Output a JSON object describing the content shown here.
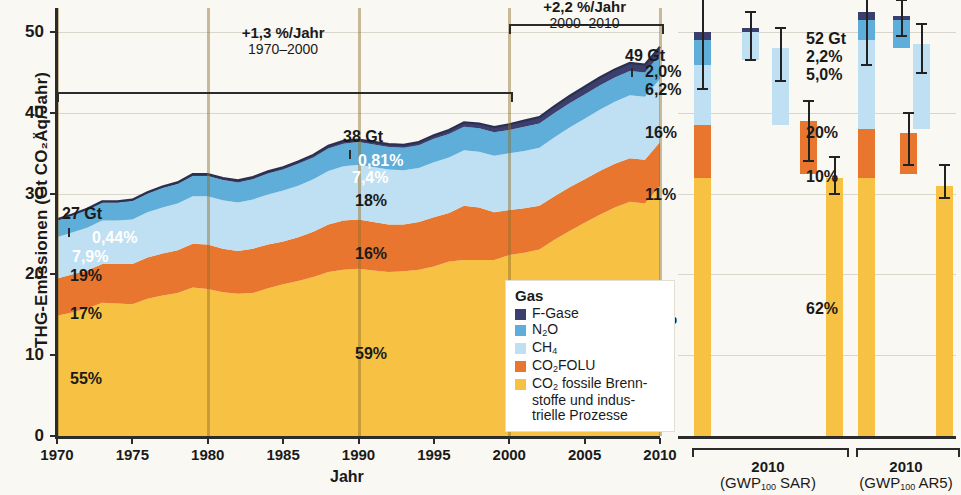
{
  "figure": {
    "y_axis_title": "THG-Emissionen (Gt CO₂Äq/Jahr)",
    "x_axis_title": "Jahr",
    "y_ticks": [
      "0",
      "10",
      "20",
      "30",
      "40",
      "50"
    ],
    "x_ticks": [
      "1970",
      "1975",
      "1980",
      "1985",
      "1990",
      "1995",
      "2000",
      "2005",
      "2010"
    ]
  },
  "annotations": [
    {
      "rate": "+1,3 %/Jahr",
      "period": "1970–2000"
    },
    {
      "rate": "+2,2 %/Jahr",
      "period": "2000–2010"
    }
  ],
  "callouts": [
    {
      "year": "1970",
      "total": "27 Gt",
      "shares": [
        "0,44%",
        "7,9%",
        "19%",
        "17%",
        "55%"
      ]
    },
    {
      "year": "1990",
      "total": "38 Gt",
      "shares": [
        "0,81%",
        "7,4%",
        "18%",
        "16%",
        "59%"
      ]
    },
    {
      "year": "2010",
      "total": "49 Gt",
      "shares": [
        "2,0%",
        "6,2%",
        "16%",
        "11%",
        "65%"
      ]
    }
  ],
  "right_panels": [
    {
      "total": "52 Gt",
      "shares": [
        "2,2%",
        "5,0%",
        "20%",
        "10%",
        "62%"
      ],
      "group_year": "2010",
      "group_metric_pre": "(GWP",
      "group_metric_sub": "100",
      "group_metric_post": " SAR)"
    },
    {
      "group_year": "2010",
      "group_metric_pre": "(GWP",
      "group_metric_sub": "100",
      "group_metric_post": " AR5)"
    }
  ],
  "legend": {
    "title": "Gas",
    "items": [
      {
        "label_pre": "F-Gase",
        "label_sub": "",
        "label_post": "",
        "color": "#3b3f6e"
      },
      {
        "label_pre": "N",
        "label_sub": "2",
        "label_post": "O",
        "color": "#5fadd9"
      },
      {
        "label_pre": "CH",
        "label_sub": "4",
        "label_post": "",
        "color": "#b9dcf2"
      },
      {
        "label_pre": "CO",
        "label_sub": "2",
        "label_post": "FOLU",
        "color": "#e8762f"
      },
      {
        "label_pre": "CO",
        "label_sub": "2",
        "label_post": " fossile Brenn-",
        "line2": "stoffe und indus-",
        "line3": "trielle Prozesse",
        "color": "#f7c килограм"
      }
    ]
  },
  "colors": {
    "f_gase": "#3b3f6e",
    "n2o": "#5fadd9",
    "ch4": "#bfdff2",
    "co2_folu": "#e8762f",
    "co2_fossil": "#f7c244",
    "grid": "#d9d6cc",
    "axis": "#2b2b2b",
    "background": "#faf8f2"
  },
  "chart_data": {
    "type": "area",
    "title": "",
    "xlabel": "Jahr",
    "ylabel": "THG-Emissionen (Gt CO₂Äq/Jahr)",
    "xlim": [
      1970,
      2010
    ],
    "ylim": [
      0,
      53
    ],
    "ytick_values": [
      0,
      10,
      20,
      30,
      40,
      50
    ],
    "grid": true,
    "legend_position": "inside-bottom-right",
    "x": [
      1970,
      1971,
      1972,
      1973,
      1974,
      1975,
      1976,
      1977,
      1978,
      1979,
      1980,
      1981,
      1982,
      1983,
      1984,
      1985,
      1986,
      1987,
      1988,
      1989,
      1990,
      1991,
      1992,
      1993,
      1994,
      1995,
      1996,
      1997,
      1998,
      1999,
      2000,
      2001,
      2002,
      2003,
      2004,
      2005,
      2006,
      2007,
      2008,
      2009,
      2010
    ],
    "series": [
      {
        "name": "CO2 fossile Brennstoffe und industrielle Prozesse",
        "color": "#f7c244",
        "values": [
          14.9,
          15.3,
          15.8,
          16.5,
          16.4,
          16.3,
          17.0,
          17.4,
          17.7,
          18.4,
          18.2,
          17.8,
          17.6,
          17.7,
          18.3,
          18.8,
          19.2,
          19.7,
          20.3,
          20.6,
          20.7,
          20.5,
          20.3,
          20.4,
          20.6,
          21.0,
          21.6,
          21.8,
          21.8,
          21.8,
          22.4,
          22.7,
          23.1,
          24.3,
          25.4,
          26.4,
          27.4,
          28.3,
          29.0,
          28.8,
          31.0
        ]
      },
      {
        "name": "CO2 FOLU",
        "color": "#e8762f",
        "values": [
          4.6,
          4.7,
          4.7,
          4.8,
          4.9,
          5.0,
          5.1,
          5.2,
          5.3,
          5.4,
          5.5,
          5.4,
          5.3,
          5.5,
          5.4,
          5.3,
          5.4,
          5.6,
          5.9,
          6.1,
          6.1,
          6.0,
          5.9,
          5.8,
          5.9,
          6.1,
          6.0,
          6.7,
          6.5,
          5.9,
          5.6,
          5.5,
          5.4,
          5.4,
          5.4,
          5.4,
          5.4,
          5.4,
          5.4,
          5.4,
          5.4
        ]
      },
      {
        "name": "CH4",
        "color": "#bfdff2",
        "values": [
          5.1,
          5.2,
          5.3,
          5.4,
          5.4,
          5.5,
          5.6,
          5.7,
          5.8,
          5.9,
          6.0,
          6.0,
          6.0,
          6.1,
          6.2,
          6.3,
          6.4,
          6.5,
          6.6,
          6.7,
          6.8,
          6.8,
          6.8,
          6.7,
          6.7,
          6.8,
          6.9,
          6.9,
          6.9,
          7.0,
          7.0,
          7.1,
          7.2,
          7.3,
          7.4,
          7.5,
          7.6,
          7.7,
          7.8,
          7.8,
          7.8
        ]
      },
      {
        "name": "N2O",
        "color": "#5fadd9",
        "values": [
          2.1,
          2.1,
          2.2,
          2.2,
          2.2,
          2.3,
          2.3,
          2.4,
          2.4,
          2.5,
          2.5,
          2.5,
          2.5,
          2.5,
          2.6,
          2.6,
          2.7,
          2.7,
          2.8,
          2.8,
          2.8,
          2.8,
          2.8,
          2.8,
          2.8,
          2.9,
          2.9,
          2.9,
          2.9,
          2.9,
          2.9,
          3.0,
          3.0,
          3.0,
          3.0,
          3.0,
          3.0,
          3.0,
          3.0,
          3.0,
          3.0
        ]
      },
      {
        "name": "F-Gase",
        "color": "#3b3f6e",
        "values": [
          0.12,
          0.13,
          0.14,
          0.15,
          0.16,
          0.17,
          0.18,
          0.19,
          0.2,
          0.22,
          0.23,
          0.24,
          0.25,
          0.26,
          0.27,
          0.28,
          0.3,
          0.31,
          0.33,
          0.34,
          0.31,
          0.32,
          0.34,
          0.36,
          0.4,
          0.45,
          0.5,
          0.55,
          0.6,
          0.65,
          0.7,
          0.75,
          0.8,
          0.85,
          0.9,
          0.95,
          1.0,
          1.0,
          1.0,
          1.0,
          1.0
        ]
      }
    ],
    "totals_labeled": [
      {
        "year": 1970,
        "value": 27,
        "label": "27 Gt"
      },
      {
        "year": 1990,
        "value": 38,
        "label": "38 Gt"
      },
      {
        "year": 2010,
        "value": 49,
        "label": "49 Gt"
      }
    ],
    "growth_annotations": [
      {
        "label": "+1,3 %/Jahr",
        "period": "1970–2000",
        "start": 1970,
        "end": 2000
      },
      {
        "label": "+2,2 %/Jahr",
        "period": "2000–2010",
        "start": 2000,
        "end": 2010
      }
    ],
    "side_panels": [
      {
        "name": "2010 (GWP100 SAR)",
        "total": 49,
        "bars": [
          {
            "name": "Gesamt",
            "segments": [
              {
                "gas": "CO2 fossile Brennstoffe und industrielle Prozesse",
                "from": 0,
                "to": 32.0,
                "color": "#f7c244"
              },
              {
                "gas": "CO2 FOLU",
                "from": 32.0,
                "to": 38.5,
                "color": "#e8762f"
              },
              {
                "gas": "CH4",
                "from": 38.5,
                "to": 46.0,
                "color": "#bfdff2"
              },
              {
                "gas": "N2O",
                "from": 46.0,
                "to": 49.0,
                "color": "#5fadd9"
              },
              {
                "gas": "F-Gase",
                "from": 49.0,
                "to": 50.0,
                "color": "#3b3f6e"
              }
            ],
            "error_low": 43.0,
            "error_high": 56.0
          },
          {
            "name": "N2O-Band",
            "segments": [
              {
                "gas": "N2O",
                "from": 46.5,
                "to": 50.0,
                "color": "#bfdff2"
              },
              {
                "gas": "F-Gase",
                "from": 50.0,
                "to": 50.5,
                "color": "#3b3f6e"
              }
            ],
            "error_low": 46.5,
            "error_high": 52.5
          },
          {
            "name": "CH4-Band",
            "segments": [
              {
                "gas": "CH4",
                "from": 38.5,
                "to": 48.0,
                "color": "#bfdff2"
              }
            ],
            "error_low": 44.0,
            "error_high": 50.5
          },
          {
            "name": "CO2FOLU-Band",
            "segments": [
              {
                "gas": "CO2 FOLU",
                "from": 32.5,
                "to": 39.0,
                "color": "#e8762f"
              }
            ],
            "error_low": 34.0,
            "error_high": 41.5
          },
          {
            "name": "CO2-fossil-Band",
            "segments": [
              {
                "gas": "CO2 fossile Brennstoffe und industrielle Prozesse",
                "from": 0,
                "to": 32.0,
                "color": "#f7c244"
              }
            ],
            "error_low": 30.0,
            "error_high": 34.5
          }
        ]
      },
      {
        "name": "2010 (GWP100 AR5)",
        "total": 52,
        "bars": [
          {
            "name": "Gesamt",
            "segments": [
              {
                "gas": "CO2 fossile Brennstoffe und industrielle Prozesse",
                "from": 0,
                "to": 32.0,
                "color": "#f7c244"
              },
              {
                "gas": "CO2 FOLU",
                "from": 32.0,
                "to": 38.0,
                "color": "#e8762f"
              },
              {
                "gas": "CH4",
                "from": 38.0,
                "to": 49.0,
                "color": "#bfdff2"
              },
              {
                "gas": "N2O",
                "from": 49.0,
                "to": 51.5,
                "color": "#5fadd9"
              },
              {
                "gas": "F-Gase",
                "from": 51.5,
                "to": 52.5,
                "color": "#3b3f6e"
              }
            ],
            "error_low": 46.0,
            "error_high": 58.5
          },
          {
            "name": "N2O-Band",
            "segments": [
              {
                "gas": "N2O",
                "from": 48.0,
                "to": 51.5,
                "color": "#5fadd9"
              },
              {
                "gas": "F-Gase",
                "from": 51.5,
                "to": 52.0,
                "color": "#3b3f6e"
              }
            ],
            "error_low": 49.5,
            "error_high": 54.0
          },
          {
            "name": "CH4-Band",
            "segments": [
              {
                "gas": "CH4",
                "from": 38.0,
                "to": 48.5,
                "color": "#bfdff2"
              }
            ],
            "error_low": 45.0,
            "error_high": 51.0
          },
          {
            "name": "CO2FOLU-Band",
            "segments": [
              {
                "gas": "CO2 FOLU",
                "from": 32.5,
                "to": 37.5,
                "color": "#e8762f"
              }
            ],
            "error_low": 33.5,
            "error_high": 40.0
          },
          {
            "name": "CO2-fossil-Band",
            "segments": [
              {
                "gas": "CO2 fossile Brennstoffe und industrielle Prozesse",
                "from": 0,
                "to": 31.0,
                "color": "#f7c244"
              }
            ],
            "error_low": 29.5,
            "error_high": 33.5
          }
        ]
      }
    ]
  }
}
